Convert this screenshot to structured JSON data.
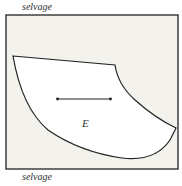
{
  "diagram": {
    "top_label": "selvage",
    "bottom_label": "selvage",
    "region_label": "E",
    "colors": {
      "fabric": "#f3f2ec",
      "piece": "#ffffff",
      "stroke": "#222222"
    },
    "arrow": {
      "direction": "double-headed horizontal",
      "x1": 57,
      "x2": 111,
      "y": 99
    }
  }
}
